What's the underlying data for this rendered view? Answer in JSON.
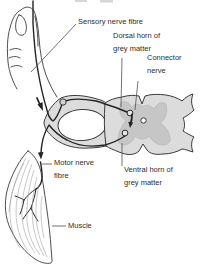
{
  "figure": {
    "labels": {
      "sensory": "Sensory nerve fibre",
      "dorsal_horn": "Dorsal horn of\ngrey matter",
      "connector": "Connector\nnerve",
      "motor": "Motor nerve\nfibre",
      "ventral_horn": "Ventral horn of\ngrey matter",
      "muscle": "Muscle"
    },
    "colors": {
      "background": "#ffffff",
      "outline": "#3a3a3a",
      "nerve_line": "#232323",
      "leader": "#4f4f4f",
      "cord_fill": "#dcdcdc",
      "grey_matter_fill": "#c6c6c6",
      "nerve_sheath_fill": "#dcdcdc",
      "ganglion_fill": "#cfcfcf",
      "canal_fill": "#ffffff",
      "synapse_fill": "#e4e4e4",
      "muscle_fibre": "#9a9a9a",
      "text": "#2e2e2e"
    }
  }
}
